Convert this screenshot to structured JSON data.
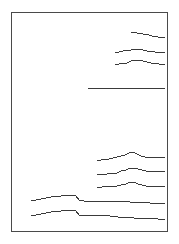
{
  "figure": {
    "title": "",
    "background_color": "#ffffff",
    "frame_color": "#4a4a4a",
    "trace_color": "#3a3a3a",
    "width": 179,
    "height": 244
  },
  "frame": {
    "left": 11,
    "top": 12,
    "right": 168,
    "bottom": 232
  },
  "chart_data": {
    "type": "line",
    "title": "",
    "xlabel": "",
    "ylabel": "",
    "xlim": [
      11,
      168
    ],
    "ylim": [
      12,
      232
    ],
    "grid": false,
    "legend": "none",
    "axis_ticks": false,
    "axis_labels": false,
    "note": "Nine horizontal strip-chart traces stacked vertically inside a plain rectangular frame. Each trace is a near-flat line with small step-like fluctuations. Traces begin at different x positions and all terminate near the right frame edge. Coordinates are in screenshot pixel space (x right, y down).",
    "series": [
      {
        "name": "trace-1",
        "baseline_y": 35,
        "x_start": 131,
        "x_end": 165,
        "points": [
          [
            131,
            33
          ],
          [
            134,
            32
          ],
          [
            137,
            33
          ],
          [
            140,
            33
          ],
          [
            143,
            34
          ],
          [
            146,
            34
          ],
          [
            149,
            35
          ],
          [
            152,
            36
          ],
          [
            155,
            36
          ],
          [
            158,
            37
          ],
          [
            161,
            37
          ],
          [
            165,
            37
          ]
        ]
      },
      {
        "name": "trace-2",
        "baseline_y": 51,
        "x_start": 115,
        "x_end": 165,
        "points": [
          [
            115,
            52
          ],
          [
            119,
            52
          ],
          [
            123,
            51
          ],
          [
            127,
            50
          ],
          [
            131,
            50
          ],
          [
            135,
            49
          ],
          [
            139,
            49
          ],
          [
            143,
            50
          ],
          [
            147,
            51
          ],
          [
            151,
            51
          ],
          [
            155,
            52
          ],
          [
            159,
            52
          ],
          [
            165,
            52
          ]
        ]
      },
      {
        "name": "trace-3",
        "baseline_y": 63,
        "x_start": 115,
        "x_end": 165,
        "points": [
          [
            115,
            64
          ],
          [
            119,
            64
          ],
          [
            123,
            63
          ],
          [
            127,
            63
          ],
          [
            131,
            61
          ],
          [
            135,
            60
          ],
          [
            139,
            60
          ],
          [
            143,
            61
          ],
          [
            147,
            62
          ],
          [
            151,
            63
          ],
          [
            155,
            63
          ],
          [
            159,
            64
          ],
          [
            165,
            64
          ]
        ]
      },
      {
        "name": "trace-4",
        "baseline_y": 88,
        "x_start": 88,
        "x_end": 165,
        "points": [
          [
            88,
            88
          ],
          [
            110,
            88
          ],
          [
            130,
            88
          ],
          [
            150,
            88
          ],
          [
            165,
            88
          ]
        ]
      },
      {
        "name": "trace-5",
        "baseline_y": 158,
        "x_start": 97,
        "x_end": 165,
        "points": [
          [
            97,
            161
          ],
          [
            101,
            160
          ],
          [
            105,
            159
          ],
          [
            109,
            159
          ],
          [
            113,
            158
          ],
          [
            117,
            157
          ],
          [
            121,
            156
          ],
          [
            125,
            155
          ],
          [
            129,
            153
          ],
          [
            133,
            152
          ],
          [
            137,
            154
          ],
          [
            141,
            156
          ],
          [
            145,
            157
          ],
          [
            149,
            157
          ],
          [
            153,
            157
          ],
          [
            157,
            157
          ],
          [
            161,
            157
          ],
          [
            165,
            157
          ]
        ]
      },
      {
        "name": "trace-6",
        "baseline_y": 172,
        "x_start": 97,
        "x_end": 165,
        "points": [
          [
            97,
            174
          ],
          [
            102,
            174
          ],
          [
            107,
            174
          ],
          [
            112,
            173
          ],
          [
            117,
            173
          ],
          [
            121,
            171
          ],
          [
            126,
            170
          ],
          [
            130,
            168
          ],
          [
            134,
            168
          ],
          [
            138,
            169
          ],
          [
            142,
            170
          ],
          [
            146,
            171
          ],
          [
            150,
            171
          ],
          [
            155,
            171
          ],
          [
            160,
            171
          ],
          [
            165,
            171
          ]
        ]
      },
      {
        "name": "trace-7",
        "baseline_y": 186,
        "x_start": 97,
        "x_end": 165,
        "points": [
          [
            97,
            187
          ],
          [
            102,
            187
          ],
          [
            107,
            186
          ],
          [
            112,
            186
          ],
          [
            117,
            186
          ],
          [
            121,
            185
          ],
          [
            126,
            184
          ],
          [
            130,
            182
          ],
          [
            134,
            182
          ],
          [
            138,
            184
          ],
          [
            142,
            185
          ],
          [
            146,
            186
          ],
          [
            150,
            186
          ],
          [
            155,
            186
          ],
          [
            160,
            186
          ],
          [
            165,
            186
          ]
        ]
      },
      {
        "name": "trace-8",
        "baseline_y": 200,
        "x_start": 31,
        "x_end": 165,
        "points": [
          [
            31,
            201
          ],
          [
            36,
            200
          ],
          [
            41,
            199
          ],
          [
            46,
            198
          ],
          [
            51,
            197
          ],
          [
            56,
            196
          ],
          [
            61,
            196
          ],
          [
            66,
            195
          ],
          [
            71,
            195
          ],
          [
            76,
            196
          ],
          [
            79,
            200
          ],
          [
            84,
            201
          ],
          [
            92,
            201
          ],
          [
            100,
            201
          ],
          [
            110,
            201
          ],
          [
            120,
            201
          ],
          [
            130,
            202
          ],
          [
            140,
            202
          ],
          [
            150,
            203
          ],
          [
            158,
            203
          ],
          [
            165,
            203
          ]
        ]
      },
      {
        "name": "trace-9",
        "baseline_y": 214,
        "x_start": 31,
        "x_end": 165,
        "points": [
          [
            31,
            216
          ],
          [
            36,
            215
          ],
          [
            41,
            214
          ],
          [
            46,
            213
          ],
          [
            51,
            212
          ],
          [
            56,
            211
          ],
          [
            61,
            211
          ],
          [
            66,
            210
          ],
          [
            71,
            210
          ],
          [
            76,
            211
          ],
          [
            79,
            215
          ],
          [
            86,
            215
          ],
          [
            94,
            215
          ],
          [
            102,
            215
          ],
          [
            110,
            216
          ],
          [
            118,
            217
          ],
          [
            126,
            217
          ],
          [
            134,
            218
          ],
          [
            142,
            218
          ],
          [
            150,
            218
          ],
          [
            158,
            219
          ],
          [
            165,
            219
          ]
        ]
      }
    ]
  }
}
